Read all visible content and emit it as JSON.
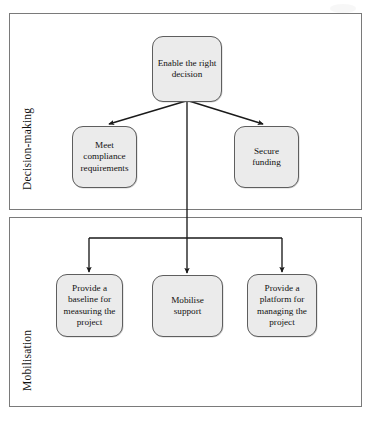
{
  "diagram": {
    "type": "hierarchy-tree",
    "panels": [
      {
        "id": "decision",
        "label": "Decision-making",
        "nodes": [
          {
            "id": "enable",
            "text": "Enable the right decision"
          },
          {
            "id": "compliance",
            "text": "Meet compliance requirements"
          },
          {
            "id": "funding",
            "text": "Secure funding"
          }
        ]
      },
      {
        "id": "mobilisation",
        "label": "Mobilisation",
        "nodes": [
          {
            "id": "baseline",
            "text": "Provide a baseline for measuring the project"
          },
          {
            "id": "mobilise",
            "text": "Mobilise support"
          },
          {
            "id": "platform",
            "text": "Provide a platform for managing the project"
          }
        ]
      }
    ],
    "colors": {
      "node_fill": "#ebebeb",
      "node_border": "#5e5e5e",
      "panel_border": "#7a7a7a",
      "connector": "#1a1a1a",
      "text": "#121212",
      "background": "#ffffff"
    },
    "edges": [
      {
        "from": "enable",
        "to": "compliance",
        "style": "arrow-diagonal"
      },
      {
        "from": "enable",
        "to": "funding",
        "style": "arrow-diagonal"
      },
      {
        "from": "enable",
        "to": "baseline",
        "style": "arrow-orthogonal"
      },
      {
        "from": "enable",
        "to": "mobilise",
        "style": "arrow-orthogonal"
      },
      {
        "from": "enable",
        "to": "platform",
        "style": "arrow-orthogonal"
      }
    ]
  }
}
